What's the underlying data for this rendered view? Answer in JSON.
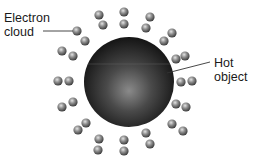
{
  "diagram": {
    "labels": {
      "electron_cloud": [
        "Electron",
        "cloud"
      ],
      "hot_object": [
        "Hot",
        "object"
      ]
    },
    "colors": {
      "background": "#ffffff",
      "sphere_dark": "#141414",
      "sphere_light": "#8a8a8a",
      "electron_dark": "#3c3c3c",
      "electron_light": "#d8d8d8",
      "leader_line": "#333333",
      "text": "#1a1a1a"
    },
    "hot_object": {
      "cx": 129,
      "cy": 82,
      "r": 45
    },
    "electrons": [
      {
        "x": 77,
        "y": 31
      },
      {
        "x": 85,
        "y": 41
      },
      {
        "x": 62,
        "y": 51
      },
      {
        "x": 73,
        "y": 56
      },
      {
        "x": 58,
        "y": 81
      },
      {
        "x": 69,
        "y": 81
      },
      {
        "x": 62,
        "y": 107
      },
      {
        "x": 73,
        "y": 102
      },
      {
        "x": 78,
        "y": 130
      },
      {
        "x": 86,
        "y": 123
      },
      {
        "x": 99,
        "y": 139
      },
      {
        "x": 98,
        "y": 150
      },
      {
        "x": 124,
        "y": 140
      },
      {
        "x": 124,
        "y": 151
      },
      {
        "x": 146,
        "y": 133
      },
      {
        "x": 150,
        "y": 144
      },
      {
        "x": 172,
        "y": 124
      },
      {
        "x": 183,
        "y": 131
      },
      {
        "x": 176,
        "y": 104
      },
      {
        "x": 186,
        "y": 107
      },
      {
        "x": 181,
        "y": 82
      },
      {
        "x": 192,
        "y": 81
      },
      {
        "x": 176,
        "y": 59
      },
      {
        "x": 185,
        "y": 56
      },
      {
        "x": 164,
        "y": 41
      },
      {
        "x": 172,
        "y": 33
      },
      {
        "x": 150,
        "y": 17
      },
      {
        "x": 146,
        "y": 28
      },
      {
        "x": 124,
        "y": 12
      },
      {
        "x": 124,
        "y": 24
      },
      {
        "x": 99,
        "y": 15
      },
      {
        "x": 103,
        "y": 25
      }
    ],
    "leaders": {
      "electron_cloud": {
        "x1": 43,
        "y1": 31,
        "x2": 73,
        "y2": 31
      },
      "hot_object": {
        "x1": 167,
        "y1": 73,
        "x2": 210,
        "y2": 62
      }
    }
  }
}
